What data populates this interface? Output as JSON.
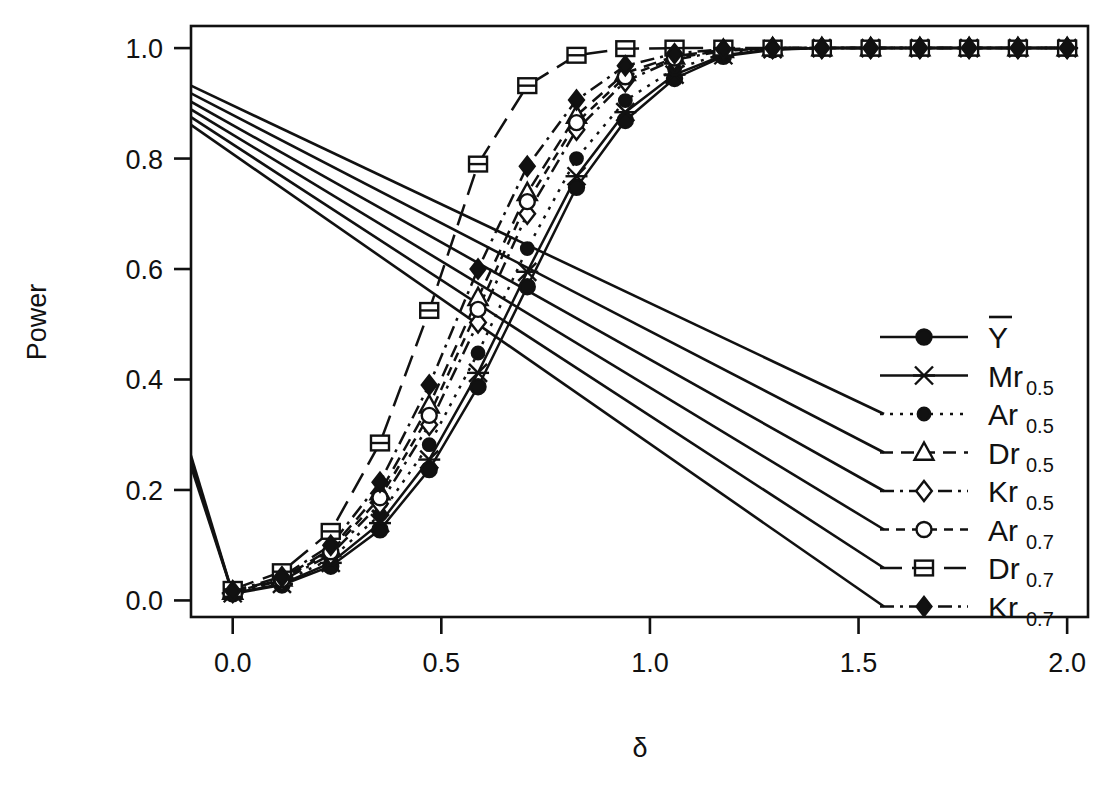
{
  "chart_data": {
    "type": "line",
    "title": "",
    "xlabel": "δ",
    "ylabel": "Power",
    "xlim": [
      -0.1,
      2.05
    ],
    "ylim": [
      -0.03,
      1.04
    ],
    "xticks": [
      "0.0",
      "0.5",
      "1.0",
      "1.5",
      "2.0"
    ],
    "xtick_values": [
      0.0,
      0.5,
      1.0,
      1.5,
      2.0
    ],
    "yticks": [
      "0.0",
      "0.2",
      "0.4",
      "0.6",
      "0.8",
      "1.0"
    ],
    "ytick_values": [
      0.0,
      0.2,
      0.4,
      0.6,
      0.8,
      1.0
    ],
    "grid": false,
    "legend_position": "bottom-right",
    "x": [
      0.0,
      0.118,
      0.235,
      0.353,
      0.471,
      0.588,
      0.706,
      0.824,
      0.941,
      1.059,
      1.176,
      1.294,
      1.412,
      1.529,
      1.647,
      1.765,
      1.882,
      2.0
    ],
    "series": [
      {
        "name": "Ybar",
        "label": "Y",
        "sub": "",
        "overbar": true,
        "marker": "filled-circle",
        "line": "solid",
        "values": [
          0.012,
          0.028,
          0.062,
          0.128,
          0.237,
          0.387,
          0.568,
          0.748,
          0.869,
          0.945,
          0.985,
          0.997,
          1.0,
          1.0,
          1.0,
          1.0,
          1.0,
          1.0
        ]
      },
      {
        "name": "Mr0.5",
        "label": "Mr",
        "sub": "0.5",
        "overbar": false,
        "marker": "cross-x",
        "line": "solid",
        "values": [
          0.013,
          0.03,
          0.068,
          0.14,
          0.255,
          0.412,
          0.595,
          0.768,
          0.884,
          0.952,
          0.987,
          0.998,
          1.0,
          1.0,
          1.0,
          1.0,
          1.0,
          1.0
        ]
      },
      {
        "name": "Ar0.5",
        "label": "Ar",
        "sub": "0.5",
        "overbar": false,
        "marker": "filled-circle-small",
        "line": "dotted",
        "values": [
          0.014,
          0.033,
          0.075,
          0.155,
          0.282,
          0.448,
          0.637,
          0.8,
          0.905,
          0.962,
          0.99,
          0.999,
          1.0,
          1.0,
          1.0,
          1.0,
          1.0,
          1.0
        ]
      },
      {
        "name": "Dr0.5",
        "label": "Dr",
        "sub": "0.5",
        "overbar": false,
        "marker": "open-triangle",
        "line": "dashed",
        "values": [
          0.016,
          0.04,
          0.093,
          0.196,
          0.353,
          0.548,
          0.738,
          0.878,
          0.955,
          0.985,
          0.997,
          1.0,
          1.0,
          1.0,
          1.0,
          1.0,
          1.0,
          1.0
        ]
      },
      {
        "name": "Kr0.5",
        "label": "Kr",
        "sub": "0.5",
        "overbar": false,
        "marker": "open-diamond",
        "line": "dashdot",
        "values": [
          0.015,
          0.036,
          0.083,
          0.175,
          0.318,
          0.503,
          0.7,
          0.852,
          0.94,
          0.979,
          0.995,
          1.0,
          1.0,
          1.0,
          1.0,
          1.0,
          1.0,
          1.0
        ]
      },
      {
        "name": "Ar0.7",
        "label": "Ar",
        "sub": "0.7",
        "overbar": false,
        "marker": "open-circle",
        "line": "dashed-short",
        "values": [
          0.015,
          0.038,
          0.088,
          0.186,
          0.335,
          0.527,
          0.722,
          0.865,
          0.948,
          0.982,
          0.996,
          1.0,
          1.0,
          1.0,
          1.0,
          1.0,
          1.0,
          1.0
        ]
      },
      {
        "name": "Dr0.7",
        "label": "Dr",
        "sub": "0.7",
        "overbar": false,
        "marker": "open-square",
        "line": "longdash",
        "values": [
          0.02,
          0.052,
          0.125,
          0.285,
          0.525,
          0.79,
          0.932,
          0.987,
          0.999,
          1.0,
          1.0,
          1.0,
          1.0,
          1.0,
          1.0,
          1.0,
          1.0,
          1.0
        ]
      },
      {
        "name": "Kr0.7",
        "label": "Kr",
        "sub": "0.7",
        "overbar": false,
        "marker": "filled-diamond",
        "line": "dashdot",
        "values": [
          0.017,
          0.043,
          0.1,
          0.214,
          0.39,
          0.6,
          0.786,
          0.906,
          0.968,
          0.99,
          0.998,
          1.0,
          1.0,
          1.0,
          1.0,
          1.0,
          1.0,
          1.0
        ]
      }
    ],
    "leader_lines": {
      "note": "straight guide lines drawn from the left plot edge to the legend keys",
      "upper_start_y": [
        0.932,
        0.918,
        0.903,
        0.889,
        0.875,
        0.861
      ],
      "lower_start_y": [
        0.262,
        0.252,
        0.243
      ]
    }
  }
}
